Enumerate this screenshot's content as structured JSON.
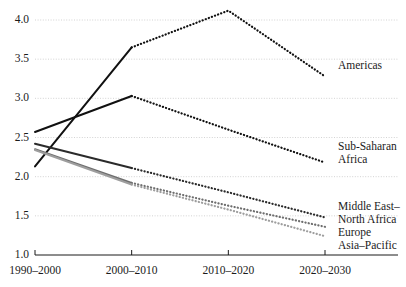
{
  "chart_data": {
    "type": "line",
    "title": "",
    "subtitle": "",
    "xlabel": "",
    "ylabel": "",
    "categories": [
      "1990–2000",
      "2000–2010",
      "2010–2020",
      "2020–2030"
    ],
    "x_tick_labels": [
      "1990–2000",
      "2000–2010",
      "2010–2020",
      "2020–2030"
    ],
    "y_tick_labels": [
      "1.0",
      "1.5",
      "2.0",
      "2.5",
      "3.0",
      "3.5",
      "4.0"
    ],
    "y_ticks": [
      1.0,
      1.5,
      2.0,
      2.5,
      3.0,
      3.5,
      4.0
    ],
    "ylim": [
      1.0,
      4.2
    ],
    "xlim": [
      0,
      3
    ],
    "grid": "horizontal-dotted",
    "legend_position": "right-inline-labels",
    "solid_segment": "1990–2000 to 2000–2010 (observed)",
    "dotted_segment": "2000–2010 onward (projected)",
    "series": [
      {
        "name": "Americas",
        "label": "Americas",
        "color": "#111111",
        "values": [
          2.13,
          3.65,
          4.12,
          3.28
        ],
        "label_x": 338,
        "label_y": 59
      },
      {
        "name": "Sub-Saharan Africa",
        "label": "Sub-Saharan\nAfrica",
        "label_line1": "Sub-Saharan",
        "label_line2": "Africa",
        "color": "#111111",
        "values": [
          2.57,
          3.03,
          2.6,
          2.18
        ],
        "label_x": 338,
        "label_y": 140
      },
      {
        "name": "Middle East–North Africa",
        "label": "Middle East–\nNorth Africa",
        "label_line1": "Middle East–",
        "label_line2": "North Africa",
        "color": "#2b2b2b",
        "values": [
          2.42,
          2.11,
          1.8,
          1.48
        ],
        "label_x": 338,
        "label_y": 200
      },
      {
        "name": "Europe",
        "label": "Europe",
        "color": "#6e6e6e",
        "values": [
          2.35,
          1.92,
          1.63,
          1.36
        ],
        "label_x": 338,
        "label_y": 226
      },
      {
        "name": "Asia–Pacific",
        "label": "Asia–Pacific",
        "color": "#9e9e9e",
        "values": [
          2.34,
          1.9,
          1.58,
          1.24
        ],
        "label_x": 338,
        "label_y": 239
      }
    ]
  },
  "axes": {
    "axis_color": "#1a1a1a",
    "grid_color": "#c8c8c8"
  }
}
